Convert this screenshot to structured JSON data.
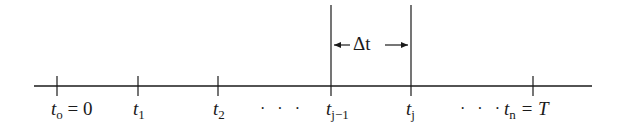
{
  "diagram": {
    "type": "timeline",
    "axis": {
      "x_start": 34,
      "x_end": 592,
      "y": 86,
      "color": "#1a1a1a"
    },
    "ticks": [
      {
        "x": 57,
        "var": "t",
        "sub": "o",
        "suffix": " = 0",
        "label": "t_o = 0"
      },
      {
        "x": 138,
        "var": "t",
        "sub": "1",
        "suffix": "",
        "label": "t_1"
      },
      {
        "x": 218,
        "var": "t",
        "sub": "2",
        "suffix": "",
        "label": "t_2"
      },
      {
        "x": 331,
        "var": "t",
        "sub": "j−1",
        "suffix": "",
        "label": "t_{j-1}",
        "tall": true
      },
      {
        "x": 411,
        "var": "t",
        "sub": "j",
        "suffix": "",
        "label": "t_j",
        "tall": true
      },
      {
        "x": 533,
        "var": "t",
        "sub": "n",
        "suffix": " = T",
        "label": "t_n = T"
      }
    ],
    "ellipses": [
      {
        "x": 258,
        "text": "· · ·"
      },
      {
        "x": 458,
        "text": "· · ·"
      }
    ],
    "interval": {
      "label": "Δt",
      "from_x": 331,
      "to_x": 411,
      "y": 45
    }
  }
}
